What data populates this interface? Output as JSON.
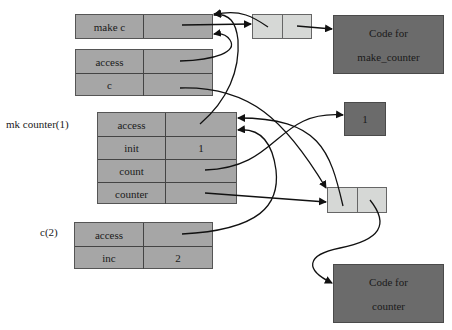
{
  "frames": {
    "global": {
      "rows": [
        {
          "name": "make c",
          "value": ""
        }
      ]
    },
    "global_ext": {
      "rows": [
        {
          "name": "access",
          "value": ""
        },
        {
          "name": "c",
          "value": ""
        }
      ]
    },
    "mk_counter": {
      "label": "mk counter(1)",
      "rows": [
        {
          "name": "access",
          "value": ""
        },
        {
          "name": "init",
          "value": "1"
        },
        {
          "name": "count",
          "value": ""
        },
        {
          "name": "counter",
          "value": ""
        }
      ]
    },
    "c_call": {
      "label": "c(2)",
      "rows": [
        {
          "name": "access",
          "value": ""
        },
        {
          "name": "inc",
          "value": "2"
        }
      ]
    }
  },
  "code_blocks": {
    "make_counter": {
      "line1": "Code for",
      "line2": "make_counter"
    },
    "counter": {
      "line1": "Code for",
      "line2": "counter"
    }
  },
  "value_box": {
    "value": "1"
  },
  "colors": {
    "frame_fill": "#a6a6a6",
    "pair_fill": "#d6d8d6",
    "code_fill": "#6b6b6b",
    "arrow": "#111111"
  }
}
